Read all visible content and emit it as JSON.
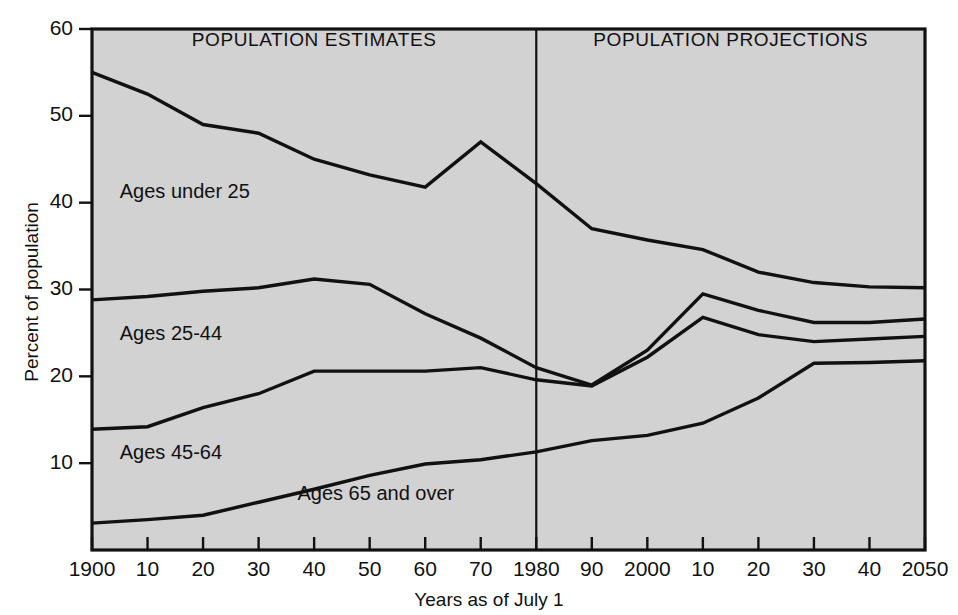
{
  "chart_data": {
    "type": "line",
    "title": "",
    "xlabel": "Years as of July 1",
    "ylabel": "Percent of population",
    "xlim": [
      1900,
      2050
    ],
    "ylim": [
      0,
      60
    ],
    "grid": false,
    "legend_position": "inline-labels",
    "x_tick_labels": [
      "1900",
      "10",
      "20",
      "30",
      "40",
      "50",
      "60",
      "70",
      "1980",
      "90",
      "2000",
      "10",
      "20",
      "30",
      "40",
      "2050"
    ],
    "x_tick_values": [
      1900,
      1910,
      1920,
      1930,
      1940,
      1950,
      1960,
      1970,
      1980,
      1990,
      2000,
      2010,
      2020,
      2030,
      2040,
      2050
    ],
    "y_tick_labels": [
      "10",
      "20",
      "30",
      "40",
      "50",
      "60"
    ],
    "y_tick_values": [
      10,
      20,
      30,
      40,
      50,
      60
    ],
    "annotations": [
      {
        "name": "panel-left",
        "text": "POPULATION ESTIMATES",
        "x": 1940,
        "y": 58
      },
      {
        "name": "panel-right",
        "text": "POPULATION PROJECTIONS",
        "x": 2015,
        "y": 58
      },
      {
        "name": "divider",
        "text": "1980",
        "x": 1980
      }
    ],
    "series": [
      {
        "name": "Ages under 25",
        "label": "Ages under 25",
        "label_x": 1905,
        "label_y": 40.5,
        "x": [
          1900,
          1910,
          1920,
          1930,
          1940,
          1950,
          1960,
          1970,
          1980,
          1990,
          2000,
          2010,
          2020,
          2030,
          2040,
          2050
        ],
        "values": [
          55.0,
          52.5,
          49.0,
          48.0,
          45.0,
          43.2,
          41.8,
          47.0,
          42.2,
          37.0,
          35.7,
          34.6,
          32.0,
          30.8,
          30.3,
          30.2
        ]
      },
      {
        "name": "Ages 25-44",
        "label": "Ages 25-44",
        "label_x": 1905,
        "label_y": 24.2,
        "x": [
          1900,
          1910,
          1920,
          1930,
          1940,
          1950,
          1960,
          1970,
          1980,
          1990,
          2000,
          2010,
          2020,
          2030,
          2040,
          2050
        ],
        "values": [
          28.8,
          29.2,
          29.8,
          30.2,
          31.2,
          30.6,
          27.2,
          24.4,
          21.0,
          19.0,
          23.0,
          29.5,
          27.6,
          26.2,
          26.2,
          26.6
        ]
      },
      {
        "name": "Ages 45-64",
        "label": "Ages 45-64",
        "label_x": 1905,
        "label_y": 10.5,
        "x": [
          1900,
          1910,
          1920,
          1930,
          1940,
          1950,
          1960,
          1970,
          1980,
          1990,
          2000,
          2010,
          2020,
          2030,
          2040,
          2050
        ],
        "values": [
          13.9,
          14.2,
          16.4,
          18.0,
          20.6,
          20.6,
          20.6,
          21.0,
          19.6,
          18.9,
          22.2,
          26.8,
          24.8,
          24.0,
          24.3,
          24.6
        ]
      },
      {
        "name": "Ages 65 and over",
        "label": "Ages 65 and over",
        "label_x": 1937,
        "label_y": 5.8,
        "x": [
          1900,
          1910,
          1920,
          1930,
          1940,
          1950,
          1960,
          1970,
          1980,
          1990,
          2000,
          2010,
          2020,
          2030,
          2040,
          2050
        ],
        "values": [
          3.1,
          3.5,
          4.0,
          5.5,
          7.0,
          8.6,
          9.9,
          10.4,
          11.3,
          12.6,
          13.2,
          14.6,
          17.5,
          21.5,
          21.6,
          21.8
        ]
      }
    ]
  },
  "axes": {
    "y_title": "Percent of population",
    "x_title": "Years as of July 1"
  }
}
